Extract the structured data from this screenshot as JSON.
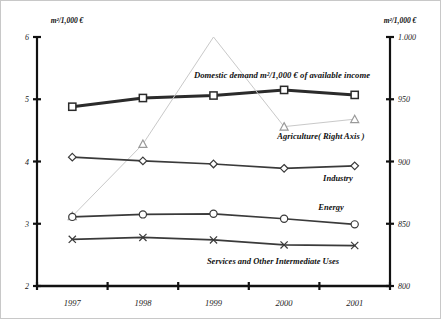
{
  "axes": {
    "left_unit_label": "m²/1,000 €",
    "right_unit_label": "m²/1,000 €",
    "left_ticks": [
      "6",
      "5",
      "4",
      "3",
      "2"
    ],
    "right_ticks": [
      "1.000",
      "950",
      "900",
      "850",
      "800"
    ]
  },
  "labels": {
    "domestic": "Domestic demand m²/1,000 € of available income",
    "agriculture": "Agriculture( Right Axis )",
    "industry": "Industry",
    "energy": "Energy",
    "services": "Services and Other Intermediate Uses"
  },
  "colors": {
    "dark": "#2b2b2b",
    "mid": "#3a3a3a",
    "light": "#c9c9c9",
    "text": "#111111"
  },
  "chart_data": {
    "type": "line",
    "title": "",
    "xlabel": "",
    "ylabel": "m²/1,000 €",
    "categories": [
      "1997",
      "1998",
      "1999",
      "2000",
      "2001"
    ],
    "ylim": [
      2,
      6
    ],
    "ylim_right": [
      800,
      1000
    ],
    "grid": false,
    "legend": "inline-annotations",
    "series": [
      {
        "name": "Domestic demand m²/1,000 € of available income",
        "axis": "left",
        "marker": "square",
        "width": "bold",
        "values": [
          4.88,
          5.02,
          5.06,
          5.15,
          5.07
        ]
      },
      {
        "name": "Agriculture( Right Axis )",
        "axis": "right",
        "marker": "triangle",
        "width": "thin",
        "values": [
          856,
          914,
          1000,
          928,
          934
        ]
      },
      {
        "name": "Industry",
        "axis": "left",
        "marker": "diamond",
        "width": "medium",
        "values": [
          4.07,
          4.01,
          3.96,
          3.89,
          3.93
        ]
      },
      {
        "name": "Energy",
        "axis": "left",
        "marker": "circle",
        "width": "medium",
        "values": [
          3.11,
          3.15,
          3.16,
          3.08,
          2.99
        ]
      },
      {
        "name": "Services and Other Intermediate Uses",
        "axis": "left",
        "marker": "cross",
        "width": "medium",
        "values": [
          2.75,
          2.78,
          2.74,
          2.66,
          2.65
        ]
      }
    ]
  }
}
